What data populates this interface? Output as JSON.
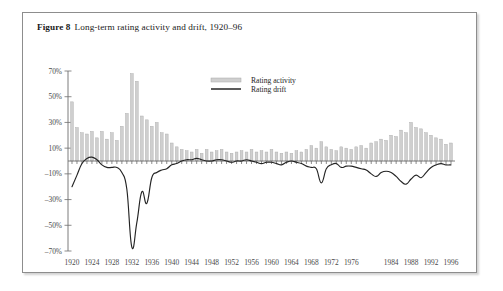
{
  "caption": {
    "label": "Figure 8",
    "title": "Long-term rating activity and drift, 1920–96"
  },
  "legend": {
    "position": "top-center",
    "items": [
      {
        "name": "rating-activity",
        "label": "Rating activity",
        "type": "bar",
        "color": "#cfcfcf"
      },
      {
        "name": "rating-drift",
        "label": "Rating drift",
        "type": "line",
        "color": "#242424"
      }
    ]
  },
  "colors": {
    "bar_fill": "#cfcfcf",
    "bar_stroke": "#a8a8a8",
    "line": "#242424",
    "axis": "#6e6e6e",
    "frame": "#8d8d8d",
    "text": "#1a1a1a",
    "tick_text": "#4a4a4a"
  },
  "chart_data": {
    "type": "bar",
    "title": "Long-term rating activity and drift, 1920–96",
    "xlabel": "",
    "ylabel": "",
    "ylim": [
      -70,
      70
    ],
    "ytick_labels": [
      "70%",
      "50%",
      "30%",
      "10%",
      "–10%",
      "–30%",
      "–50%",
      "–70%"
    ],
    "ytick_values": [
      70,
      50,
      30,
      10,
      -10,
      -30,
      -50,
      -70
    ],
    "grid": false,
    "xlim": [
      1920,
      1996
    ],
    "xtick_labels": [
      "1920",
      "1924",
      "1928",
      "1932",
      "1936",
      "1940",
      "1944",
      "1948",
      "1952",
      "1956",
      "1960",
      "1964",
      "1968",
      "1972",
      "1976",
      "1984",
      "1988",
      "1992",
      "1996"
    ],
    "xtick_values": [
      1920,
      1924,
      1928,
      1932,
      1936,
      1940,
      1944,
      1948,
      1952,
      1956,
      1960,
      1964,
      1968,
      1972,
      1976,
      1984,
      1988,
      1992,
      1996
    ],
    "x": [
      1920,
      1921,
      1922,
      1923,
      1924,
      1925,
      1926,
      1927,
      1928,
      1929,
      1930,
      1931,
      1932,
      1933,
      1934,
      1935,
      1936,
      1937,
      1938,
      1939,
      1940,
      1941,
      1942,
      1943,
      1944,
      1945,
      1946,
      1947,
      1948,
      1949,
      1950,
      1951,
      1952,
      1953,
      1954,
      1955,
      1956,
      1957,
      1958,
      1959,
      1960,
      1961,
      1962,
      1963,
      1964,
      1965,
      1966,
      1967,
      1968,
      1969,
      1970,
      1971,
      1972,
      1973,
      1974,
      1975,
      1976,
      1977,
      1978,
      1979,
      1980,
      1981,
      1982,
      1983,
      1984,
      1985,
      1986,
      1987,
      1988,
      1989,
      1990,
      1991,
      1992,
      1993,
      1994,
      1995,
      1996
    ],
    "series": [
      {
        "name": "Rating activity",
        "type": "bar",
        "values": [
          46,
          26,
          22,
          21,
          23,
          18,
          23,
          17,
          22,
          16,
          27,
          37,
          68,
          62,
          35,
          32,
          27,
          30,
          22,
          21,
          14,
          11,
          9,
          8,
          7,
          9,
          6,
          9,
          7,
          8,
          9,
          7,
          6,
          7,
          8,
          7,
          9,
          7,
          8,
          7,
          9,
          7,
          6,
          7,
          6,
          8,
          7,
          9,
          12,
          10,
          15,
          11,
          9,
          8,
          11,
          10,
          9,
          11,
          12,
          10,
          14,
          15,
          17,
          16,
          20,
          19,
          24,
          22,
          30,
          26,
          25,
          22,
          20,
          18,
          17,
          13,
          14
        ]
      },
      {
        "name": "Rating drift",
        "type": "line",
        "values": [
          -20,
          -11,
          -2,
          2,
          3,
          1,
          -3,
          -5,
          -5,
          -5,
          -9,
          -22,
          -67,
          -48,
          -24,
          -33,
          -13,
          -9,
          -7,
          -6,
          -3,
          -2,
          0,
          1,
          1,
          2,
          1,
          0,
          0,
          1,
          1,
          0,
          -1,
          0,
          0,
          1,
          0,
          -1,
          -2,
          -1,
          -1,
          -2,
          -3,
          -1,
          0,
          -1,
          -2,
          -4,
          -5,
          -6,
          -17,
          -6,
          -3,
          -2,
          -5,
          -4,
          -4,
          -5,
          -6,
          -7,
          -10,
          -12,
          -9,
          -8,
          -9,
          -12,
          -16,
          -18,
          -14,
          -11,
          -13,
          -9,
          -5,
          -3,
          -2,
          -3,
          -3
        ]
      }
    ]
  }
}
